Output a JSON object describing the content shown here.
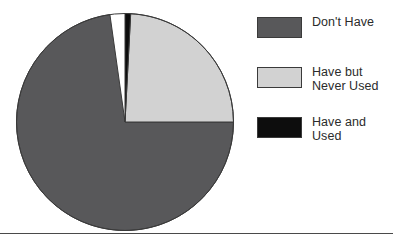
{
  "chart_data": {
    "type": "pie",
    "title": "",
    "subtitle": "",
    "xlabel": "",
    "ylabel": "",
    "grid": false,
    "legend_position": "right",
    "start_angle_deg": 0,
    "direction": "clockwise",
    "categories": [
      "Don't Have",
      "Have but Never Used",
      "Have and Used"
    ],
    "values": [
      73,
      25,
      2
    ],
    "value_unit": "percent",
    "slices": [
      {
        "label": "Don't Have",
        "label_lines": [
          "Don't Have"
        ],
        "value": 73,
        "color": "#58585a",
        "start_angle_deg": 90,
        "end_angle_deg": 352
      },
      {
        "label": "Have but Never Used",
        "label_lines": [
          "Have but",
          "Never Used"
        ],
        "value": 25,
        "color": "#d2d2d2",
        "start_angle_deg": 3,
        "end_angle_deg": 90
      },
      {
        "label": "Have and Used",
        "label_lines": [
          "Have and",
          "Used"
        ],
        "value": 2,
        "color": "#0d0d0d",
        "start_angle_deg": 0,
        "end_angle_deg": 3
      }
    ],
    "legend_entries": [
      {
        "label": "Don't Have",
        "text": "Don't Have",
        "color": "#58585a"
      },
      {
        "label": "Have but Never Used",
        "text": "Have but\nNever Used",
        "color": "#d2d2d2"
      },
      {
        "label": "Have and Used",
        "text": "Have and\nUsed",
        "color": "#0d0d0d"
      }
    ]
  },
  "figure": {
    "outline_color": "#3a3a3a",
    "background": "#ffffff",
    "rule_color": "#4a4a4a"
  }
}
